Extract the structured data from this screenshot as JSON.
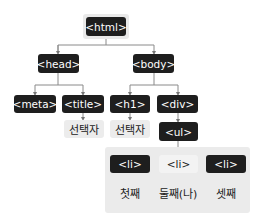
{
  "diagram": {
    "nodes": {
      "html": "<html>",
      "head": "<head>",
      "body": "<body>",
      "meta": "<meta>",
      "title": "<title>",
      "h1": "<h1>",
      "div": "<div>",
      "ul": "<ul>",
      "li1": "<li>",
      "li2": "<li>",
      "li3": "<li>"
    },
    "text_nodes": {
      "title_text": "선택자",
      "h1_text": "선택자",
      "li1_text": "첫째",
      "li2_text": "둘째(나)",
      "li3_text": "셋째"
    },
    "highlighted": [
      "html",
      "li2"
    ],
    "edges": [
      [
        "html",
        "head"
      ],
      [
        "html",
        "body"
      ],
      [
        "head",
        "meta"
      ],
      [
        "head",
        "title"
      ],
      [
        "body",
        "h1"
      ],
      [
        "body",
        "div"
      ],
      [
        "title",
        "title_text"
      ],
      [
        "h1",
        "h1_text"
      ],
      [
        "div",
        "ul"
      ],
      [
        "ul",
        "li1"
      ],
      [
        "ul",
        "li2"
      ],
      [
        "ul",
        "li3"
      ],
      [
        "li1",
        "li1_text"
      ],
      [
        "li2",
        "li2_text"
      ],
      [
        "li3",
        "li3_text"
      ]
    ],
    "colors": {
      "dark_node": "#1e1e1e",
      "light_node": "#ececec",
      "panel": "#ebebeb",
      "line": "#888888"
    }
  }
}
